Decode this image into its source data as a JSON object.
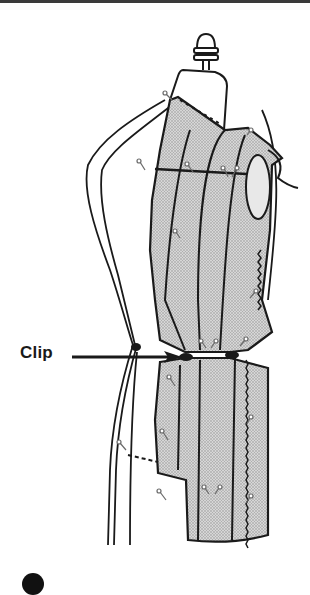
{
  "figure": {
    "type": "illustration",
    "callouts": [
      {
        "label": "Clip",
        "target": "waistline-clip"
      }
    ],
    "colors": {
      "line": "#1a1a1a",
      "fabric_fill": "#c8c8c8",
      "background": "#ffffff",
      "pins": "#8a8a8a"
    },
    "step_marker": {
      "shape": "filled-circle",
      "color": "#111111"
    }
  }
}
